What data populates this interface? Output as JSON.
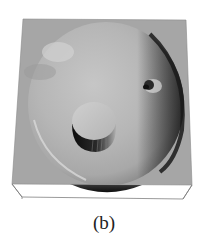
{
  "figure": {
    "caption": "(b)",
    "colors": {
      "background": "#ffffff",
      "plane": "#a6a6a6",
      "bowl_light": "#c2c2c2",
      "bowl_mid": "#b0b0b0",
      "shadow": "#1e1e1e",
      "wire": "#777777"
    },
    "features": [
      {
        "name": "square-plane",
        "type": "surface"
      },
      {
        "name": "circular-depression",
        "type": "bowl"
      },
      {
        "name": "cylinder-plug",
        "type": "raised-cylinder"
      },
      {
        "name": "small-bump",
        "type": "bump"
      },
      {
        "name": "base-wireframe",
        "type": "box-edges"
      }
    ]
  }
}
